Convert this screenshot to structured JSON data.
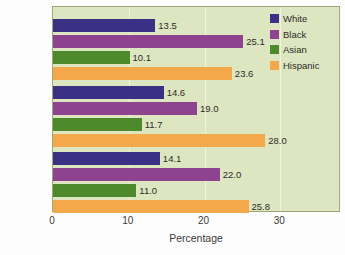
{
  "chart_data": {
    "type": "bar",
    "orientation": "horizontal",
    "title": "",
    "xlabel": "Percentage",
    "ylabel": "",
    "xlim": [
      0,
      38
    ],
    "xticks": [
      0,
      10,
      20,
      30
    ],
    "xtick_labels": [
      "0",
      "10",
      "20",
      "30"
    ],
    "grid": true,
    "grid_axis": "x",
    "legend_position": "top-right",
    "categories": [
      "Females",
      "Males",
      "Total"
    ],
    "series": [
      {
        "name": "White",
        "color": "#3b3184",
        "values": [
          13.5,
          14.6,
          14.1
        ],
        "labels": [
          "13.5",
          "14.6",
          "14.1"
        ]
      },
      {
        "name": "Black",
        "color": "#8e4390",
        "values": [
          25.1,
          19.0,
          22.0
        ],
        "labels": [
          "25.1",
          "19.0",
          "22.0"
        ]
      },
      {
        "name": "Asian",
        "color": "#4e8a2c",
        "values": [
          10.1,
          11.7,
          11.0
        ],
        "labels": [
          "10.1",
          "11.7",
          "11.0"
        ]
      },
      {
        "name": "Hispanic",
        "color": "#f3a949",
        "values": [
          23.6,
          28.0,
          25.8
        ],
        "labels": [
          "23.6",
          "28.0",
          "25.8"
        ]
      }
    ],
    "plot_background": "#dde6c0",
    "page_background": "#ffffff"
  },
  "legend": {
    "items": [
      {
        "label": "White",
        "key": "white"
      },
      {
        "label": "Black",
        "key": "black"
      },
      {
        "label": "Asian",
        "key": "asian"
      },
      {
        "label": "Hispanic",
        "key": "hispanic"
      }
    ]
  },
  "axis": {
    "title": "Percentage",
    "ticks": [
      "0",
      "10",
      "20",
      "30"
    ]
  }
}
